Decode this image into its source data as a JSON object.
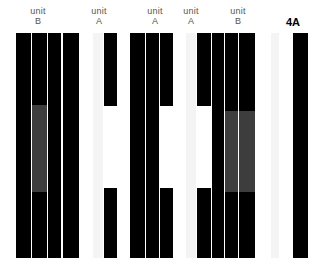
{
  "figure": {
    "width": 317,
    "height": 277,
    "background": "#ffffff",
    "panel_label": "4A",
    "colors": {
      "bar_black": "#000000",
      "bar_white": "#ffffff",
      "bar_gray": "#3d3d3d",
      "bar_faint": "#f4f4f4",
      "label_text": "#555555",
      "panel_label_text": "#000000"
    }
  },
  "header": {
    "labels": [
      {
        "line1": "unit",
        "line2": "B",
        "center_x": 38
      },
      {
        "line1": "unit",
        "line2": "A",
        "center_x": 99
      },
      {
        "line1": "unit",
        "line2": "A",
        "center_x": 155
      },
      {
        "line1": "unit",
        "line2": "A",
        "center_x": 191
      },
      {
        "line1": "unit",
        "line2": "B",
        "center_x": 238
      }
    ]
  },
  "chart_data": {
    "type": "bar",
    "title": "4A",
    "xlabel": "",
    "ylabel": "",
    "grid": false,
    "legend": "none",
    "orientation": "vertical-stripes",
    "plot_area": {
      "x": 0,
      "y": 33,
      "width": 317,
      "height": 225
    },
    "group_labels": [
      "unit B",
      "unit A",
      "unit A",
      "unit A",
      "unit B"
    ],
    "bars": [
      {
        "x": 16,
        "w": 15,
        "segments": [
          {
            "from": 0,
            "to": 225,
            "fill": "black"
          }
        ]
      },
      {
        "x": 32,
        "w": 15,
        "segments": [
          {
            "from": 0,
            "to": 72,
            "fill": "black"
          },
          {
            "from": 72,
            "to": 159,
            "fill": "gray"
          },
          {
            "from": 159,
            "to": 225,
            "fill": "black"
          }
        ]
      },
      {
        "x": 48,
        "w": 13,
        "segments": [
          {
            "from": 0,
            "to": 225,
            "fill": "black"
          }
        ]
      },
      {
        "x": 63,
        "w": 16,
        "segments": [
          {
            "from": 0,
            "to": 225,
            "fill": "black"
          }
        ]
      },
      {
        "x": 80,
        "w": 12,
        "segments": [
          {
            "from": 0,
            "to": 225,
            "fill": "white"
          }
        ]
      },
      {
        "x": 93,
        "w": 10,
        "segments": [
          {
            "from": 0,
            "to": 225,
            "fill": "faint"
          }
        ]
      },
      {
        "x": 104,
        "w": 13,
        "segments": [
          {
            "from": 0,
            "to": 73,
            "fill": "black"
          },
          {
            "from": 73,
            "to": 155,
            "fill": "white"
          },
          {
            "from": 155,
            "to": 225,
            "fill": "black"
          }
        ]
      },
      {
        "x": 118,
        "w": 11,
        "segments": [
          {
            "from": 0,
            "to": 225,
            "fill": "white"
          }
        ]
      },
      {
        "x": 130,
        "w": 15,
        "segments": [
          {
            "from": 0,
            "to": 225,
            "fill": "black"
          }
        ]
      },
      {
        "x": 146,
        "w": 13,
        "segments": [
          {
            "from": 0,
            "to": 225,
            "fill": "black"
          }
        ]
      },
      {
        "x": 160,
        "w": 13,
        "segments": [
          {
            "from": 0,
            "to": 73,
            "fill": "black"
          },
          {
            "from": 73,
            "to": 155,
            "fill": "white"
          },
          {
            "from": 155,
            "to": 225,
            "fill": "black"
          }
        ]
      },
      {
        "x": 174,
        "w": 11,
        "segments": [
          {
            "from": 0,
            "to": 225,
            "fill": "white"
          }
        ]
      },
      {
        "x": 186,
        "w": 10,
        "segments": [
          {
            "from": 0,
            "to": 225,
            "fill": "faint"
          }
        ]
      },
      {
        "x": 197,
        "w": 14,
        "segments": [
          {
            "from": 0,
            "to": 73,
            "fill": "black"
          },
          {
            "from": 73,
            "to": 155,
            "fill": "white"
          },
          {
            "from": 155,
            "to": 225,
            "fill": "black"
          }
        ]
      },
      {
        "x": 212,
        "w": 12,
        "segments": [
          {
            "from": 0,
            "to": 225,
            "fill": "black"
          }
        ]
      },
      {
        "x": 225,
        "w": 13,
        "segments": [
          {
            "from": 0,
            "to": 78,
            "fill": "black"
          },
          {
            "from": 78,
            "to": 159,
            "fill": "gray"
          },
          {
            "from": 159,
            "to": 225,
            "fill": "black"
          }
        ]
      },
      {
        "x": 239,
        "w": 16,
        "segments": [
          {
            "from": 0,
            "to": 78,
            "fill": "black"
          },
          {
            "from": 78,
            "to": 159,
            "fill": "gray"
          },
          {
            "from": 159,
            "to": 225,
            "fill": "black"
          }
        ]
      },
      {
        "x": 256,
        "w": 14,
        "segments": [
          {
            "from": 0,
            "to": 225,
            "fill": "white"
          }
        ]
      },
      {
        "x": 271,
        "w": 8,
        "segments": [
          {
            "from": 0,
            "to": 225,
            "fill": "faint"
          }
        ]
      },
      {
        "x": 280,
        "w": 12,
        "segments": [
          {
            "from": 0,
            "to": 225,
            "fill": "white"
          }
        ]
      },
      {
        "x": 293,
        "w": 15,
        "segments": [
          {
            "from": 0,
            "to": 225,
            "fill": "black"
          }
        ]
      }
    ]
  }
}
